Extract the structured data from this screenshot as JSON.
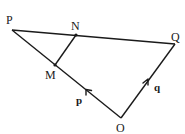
{
  "diagram": {
    "type": "geometry-vector-diagram",
    "vertices": {
      "P": {
        "label": "P",
        "x": 12,
        "y": 30
      },
      "Q": {
        "label": "Q",
        "x": 175,
        "y": 44
      },
      "O": {
        "label": "O",
        "x": 121,
        "y": 118
      },
      "N": {
        "label": "N",
        "x": 76,
        "y": 35
      },
      "M": {
        "label": "M",
        "x": 55,
        "y": 65
      }
    },
    "labels": {
      "P": "P",
      "Q": "Q",
      "O": "O",
      "N": "N",
      "M": "M"
    },
    "edges": [
      {
        "from": "P",
        "to": "Q"
      },
      {
        "from": "P",
        "to": "O"
      },
      {
        "from": "O",
        "to": "Q"
      },
      {
        "from": "M",
        "to": "N"
      }
    ],
    "vectors": {
      "p": {
        "label": "p",
        "from": "O",
        "to": "P",
        "description": "arrow on OP pointing toward P"
      },
      "q": {
        "label": "q",
        "from": "O",
        "to": "Q",
        "description": "arrow on OQ pointing toward Q"
      }
    },
    "colors": {
      "line": "#1a1a1a",
      "background": "#ffffff"
    }
  }
}
